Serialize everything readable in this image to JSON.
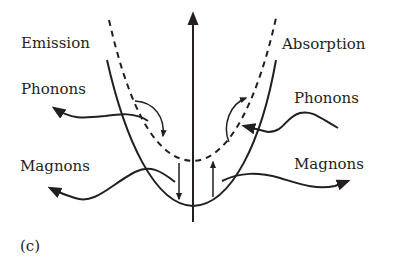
{
  "diagram": {
    "panel_label": "(c)",
    "labels": {
      "emission": "Emission",
      "absorption": "Absorption",
      "phonons_left": "Phonons",
      "phonons_right": "Phonons",
      "magnons_left": "Magnons",
      "magnons_right": "Magnons"
    },
    "elements": {
      "vertical_axis": "energy axis with arrowhead pointing up",
      "solid_parabola": "lower dispersion curve (solid)",
      "dashed_parabola": "upper dispersion curve (dashed)",
      "down_arrow": "transition from dashed to solid curve (emission)",
      "up_arrow": "transition from solid to dashed curve (absorption)"
    },
    "colors": {
      "ink": "#231f20",
      "background": "#ffffff"
    }
  }
}
